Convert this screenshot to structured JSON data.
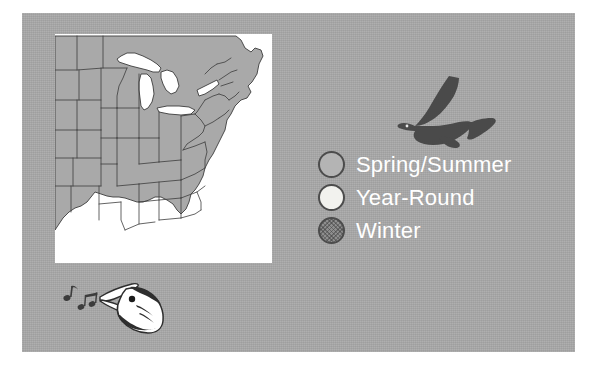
{
  "panel": {
    "background_color": "#a9a9a9"
  },
  "map": {
    "name": "eastern-united-states-range-map",
    "land_color": "#a9a9a9",
    "water_color": "#ffffff",
    "border_color": "#3c3c3c",
    "region": "Eastern and Central United States"
  },
  "icons": {
    "flying_bird": "flying-bird-icon",
    "singing_bird": "singing-bird-head-icon",
    "music_notes": "music-notes-icon"
  },
  "legend": {
    "title": "",
    "items": [
      {
        "label": "Spring/Summer",
        "swatch": "sw-spring",
        "color": "#b4b4b4"
      },
      {
        "label": "Year-Round",
        "swatch": "sw-year",
        "color": "#f2f2ee"
      },
      {
        "label": "Winter",
        "swatch": "sw-winter",
        "color": "#8e8e8e"
      }
    ],
    "text_color": "#ffffff",
    "outline_color": "#4c4c4c"
  }
}
